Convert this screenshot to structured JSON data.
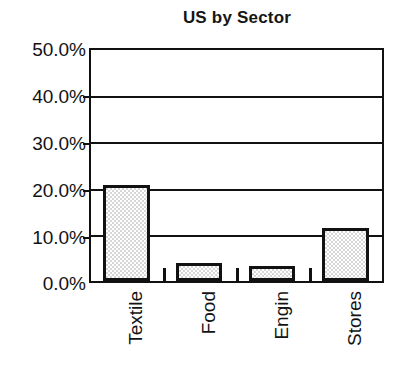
{
  "chart_data": {
    "type": "bar",
    "title": "US by Sector",
    "xlabel": "",
    "ylabel": "",
    "categories": [
      "Textile",
      "Food",
      "Engin",
      "Stores"
    ],
    "values": [
      20.8,
      4.0,
      3.2,
      11.5
    ],
    "value_labels": [
      "20.8%",
      "4.0%",
      "3.2%",
      "11.5%"
    ],
    "ylim": [
      0,
      50
    ],
    "ytick_values": [
      0,
      10,
      20,
      30,
      40,
      50
    ],
    "ytick_labels": [
      "0.0%",
      "10.0%",
      "20.0%",
      "30.0%",
      "40.0%",
      "50.0%"
    ],
    "grid": true,
    "grid_axis": "y",
    "legend": false,
    "legend_position": "none",
    "series": [
      {
        "name": "US by Sector",
        "values": [
          20.8,
          4.0,
          3.2,
          11.5
        ]
      }
    ],
    "style": {
      "bar_fill_color": "#d6d6d6",
      "bar_fill_pattern": "stipple-checker",
      "bar_edge_color": "#111111",
      "axis_color": "#111111",
      "grid_color": "#111111",
      "background_color": "#ffffff",
      "text_color": "#121212"
    }
  }
}
